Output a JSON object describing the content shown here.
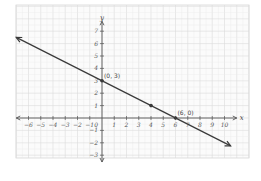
{
  "chart_data": {
    "type": "line",
    "title": "",
    "xlabel": "x",
    "ylabel": "y",
    "xlim": [
      -7,
      11
    ],
    "ylim": [
      -3.5,
      8
    ],
    "grid": true,
    "x_ticks": [
      -6,
      -5,
      -4,
      -3,
      -2,
      -1,
      1,
      2,
      3,
      4,
      5,
      6,
      7,
      8,
      9,
      10
    ],
    "y_ticks": [
      -3,
      -2,
      -1,
      1,
      2,
      3,
      4,
      5,
      6,
      7
    ],
    "origin_label": "0",
    "series": [
      {
        "name": "y = -x/2 + 3",
        "slope": -0.5,
        "intercept": 3,
        "x": [
          -7,
          0,
          4,
          6,
          10.5
        ],
        "y": [
          6.5,
          3,
          1,
          0,
          -2.25
        ],
        "arrows": "both"
      }
    ],
    "points": [
      {
        "x": 0,
        "y": 3,
        "label": "(0, 3)"
      },
      {
        "x": 4,
        "y": 1,
        "label": ""
      },
      {
        "x": 6,
        "y": 0,
        "label": "(6, 0)"
      }
    ],
    "colors": {
      "line": "#3a3a3a",
      "axis": "#555555",
      "grid_minor": "#ececec",
      "grid_major": "#dcdcdc",
      "panel_border": "#d8d8d8"
    }
  }
}
